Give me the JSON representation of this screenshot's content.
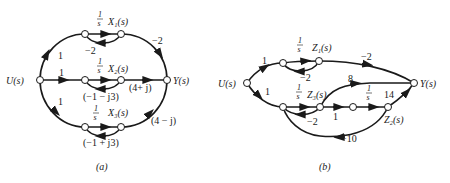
{
  "diagrams": {
    "a": {
      "caption": "(a)",
      "nodes": {
        "U": {
          "label": "U(s)",
          "x": 40,
          "y": 80
        },
        "Y": {
          "label": "Y(s)",
          "x": 167,
          "y": 80
        },
        "X1": {
          "label": "X₁(s)",
          "integrator": "1/s"
        },
        "X2": {
          "label": "X₂(s)",
          "integrator": "1/s"
        },
        "X3": {
          "label": "X₃(s)",
          "integrator": "1/s"
        }
      },
      "gains": {
        "u_to_x1": "1",
        "x1_feedback": "−2",
        "x1_to_y": "−2",
        "u_to_x2": "1",
        "x2_feedback": "(−1 − j3)",
        "x2_to_y": "(4+ j)",
        "u_to_x3": "1",
        "x3_feedback": "(−1 + j3)",
        "x3_to_y": "(4 − j)"
      },
      "integrator_num": "1",
      "integrator_den": "s"
    },
    "b": {
      "caption": "(b)",
      "nodes": {
        "U": {
          "label": "U(s)"
        },
        "Y": {
          "label": "Y(s)"
        },
        "Z1": {
          "label": "Z₁(s)",
          "integrator": "1/s"
        },
        "Z3": {
          "label": "Z₃(s)",
          "integrator": "1/s"
        },
        "Z2": {
          "label": "Z₂(s)",
          "integrator": "1/s"
        }
      },
      "gains": {
        "u_to_z1": "1",
        "z1_feedback": "−2",
        "z1_to_y": "−2",
        "u_to_z3": "1",
        "z3_feedback": "−2",
        "z3_to_y": "8",
        "z3_to_mid": "1",
        "z2_to_y": "14",
        "z2_feedback": "−10"
      },
      "integrator_num": "1",
      "integrator_den": "s"
    }
  }
}
